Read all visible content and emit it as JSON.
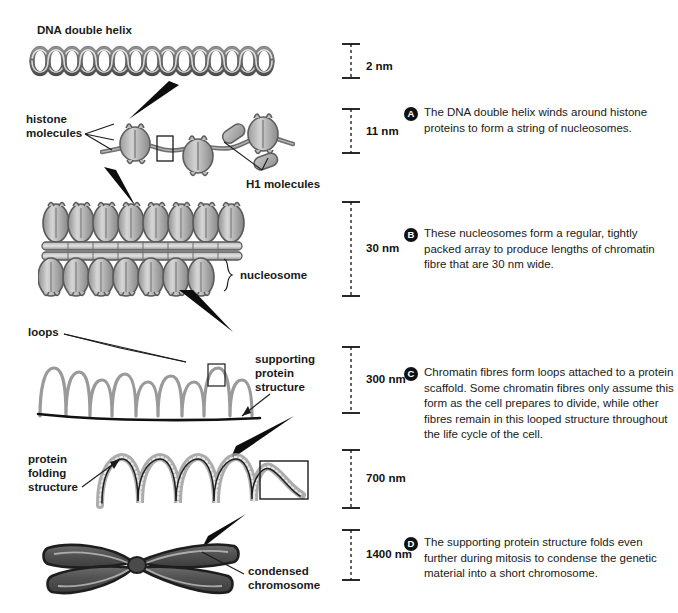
{
  "figure": {
    "background": "#ffffff",
    "ink": "#1a1a1a"
  },
  "labels": {
    "dna_double_helix": "DNA double helix",
    "histone_molecules_line1": "histone",
    "histone_molecules_line2": "molecules",
    "h1_molecules": "H1 molecules",
    "nucleosome": "nucleosome",
    "loops": "loops",
    "supporting_line1": "supporting",
    "supporting_line2": "protein",
    "supporting_line3": "structure",
    "protein_folding_line1": "protein",
    "protein_folding_line2": "folding",
    "protein_folding_line3": "structure",
    "condensed_line1": "condensed",
    "condensed_line2": "chromosome"
  },
  "scale_bars": [
    {
      "id": "scale-2nm",
      "value": "2 nm"
    },
    {
      "id": "scale-11nm",
      "value": "11 nm"
    },
    {
      "id": "scale-30nm",
      "value": "30 nm"
    },
    {
      "id": "scale-300nm",
      "value": "300 nm"
    },
    {
      "id": "scale-700nm",
      "value": "700 nm"
    },
    {
      "id": "scale-1400nm",
      "value": "1400 nm"
    }
  ],
  "notes": [
    {
      "badge": "A",
      "text": "The DNA double helix winds around histone proteins to form a string of nucleosomes."
    },
    {
      "badge": "B",
      "text": "These nucleosomes form a regular, tightly packed array to produce lengths of chromatin fibre that are 30 nm wide."
    },
    {
      "badge": "C",
      "text": "Chromatin fibres form loops attached to a protein scaffold. Some chromatin fibres only assume this form as the cell prepares to divide, while other fibres remain in this looped structure throughout the life cycle of the cell."
    },
    {
      "badge": "D",
      "text": "The supporting protein structure folds even further during mitosis to condense the genetic material into a short chromosome."
    }
  ],
  "colors": {
    "dna_strand": "#6e6e6e",
    "histone_fill": "#b9b9b9",
    "histone_dark": "#7a7a7a",
    "chromosome_fill": "#5a5a5a",
    "chromosome_edge": "#2a2a2a",
    "arrow": "#0d0d0d",
    "scale_line": "#111111"
  }
}
